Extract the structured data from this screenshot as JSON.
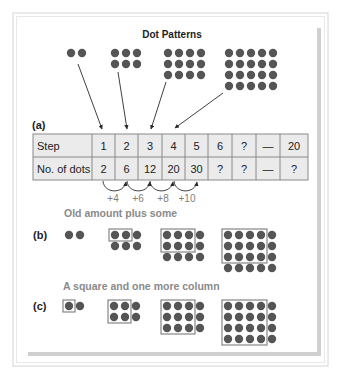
{
  "title": "Dot Patterns",
  "colors": {
    "dot": "#555555",
    "box": "#7a7a7a",
    "table_fill": "#ebebeb",
    "table_border": "#8a8a8a",
    "arrow": "#2a2a2a",
    "subtitle": "#8a8a8a"
  },
  "sections": {
    "a": {
      "label": "(a)"
    },
    "b": {
      "label": "(b)",
      "heading": "Old amount plus some"
    },
    "c": {
      "label": "(c)",
      "heading": "A square and one more column"
    }
  },
  "table": {
    "rows": [
      {
        "header": "Step",
        "cells": [
          "1",
          "2",
          "3",
          "4",
          "5",
          "6",
          "?",
          "—",
          "20"
        ]
      },
      {
        "header": "No. of dots",
        "cells": [
          "2",
          "6",
          "12",
          "20",
          "30",
          "?",
          "?",
          "—",
          "?"
        ]
      }
    ]
  },
  "increments": [
    "+4",
    "+6",
    "+8",
    "+10"
  ],
  "patterns": {
    "top": [
      {
        "cols": 2,
        "rows": 1
      },
      {
        "cols": 3,
        "rows": 2
      },
      {
        "cols": 4,
        "rows": 3
      },
      {
        "cols": 5,
        "rows": 4
      }
    ],
    "b": [
      {
        "cols": 2,
        "rows": 1,
        "box": null
      },
      {
        "cols": 3,
        "rows": 2,
        "box": [
          2,
          1
        ]
      },
      {
        "cols": 4,
        "rows": 3,
        "box": [
          3,
          2
        ]
      },
      {
        "cols": 5,
        "rows": 4,
        "box": [
          4,
          3
        ]
      }
    ],
    "c": [
      {
        "cols": 2,
        "rows": 1,
        "box": [
          1,
          1
        ]
      },
      {
        "cols": 3,
        "rows": 2,
        "box": [
          2,
          2
        ]
      },
      {
        "cols": 4,
        "rows": 3,
        "box": [
          3,
          3
        ]
      },
      {
        "cols": 5,
        "rows": 4,
        "box": [
          4,
          4
        ]
      }
    ]
  }
}
